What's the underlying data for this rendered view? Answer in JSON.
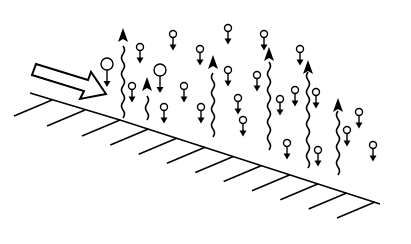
{
  "diagram": {
    "colors": {
      "stroke": "#000000",
      "background": "#ffffff"
    },
    "surface": {
      "points": [
        [
          30,
          93
        ],
        [
          120,
          120
        ],
        [
          380,
          204
        ]
      ],
      "hatch_count": 10
    },
    "incident_arrow": {
      "label": "",
      "direction": "down-right"
    },
    "rising_arrows": [
      {
        "x": 123,
        "top": 28,
        "bottom": 118
      },
      {
        "x": 147,
        "top": 77,
        "bottom": 120
      },
      {
        "x": 213,
        "top": 55,
        "bottom": 137
      },
      {
        "x": 269,
        "top": 47,
        "bottom": 150
      },
      {
        "x": 308,
        "top": 60,
        "bottom": 168
      },
      {
        "x": 338,
        "top": 98,
        "bottom": 175
      }
    ],
    "falling_particles": [
      {
        "x": 107,
        "y": 64,
        "r": 6
      },
      {
        "x": 160,
        "y": 70,
        "r": 6
      },
      {
        "x": 140,
        "y": 47,
        "r": 3.5
      },
      {
        "x": 173,
        "y": 34,
        "r": 3.5
      },
      {
        "x": 132,
        "y": 86,
        "r": 3.5
      },
      {
        "x": 164,
        "y": 107,
        "r": 3.5
      },
      {
        "x": 184,
        "y": 86,
        "r": 3.5
      },
      {
        "x": 200,
        "y": 49,
        "r": 3.5
      },
      {
        "x": 201,
        "y": 107,
        "r": 3.5
      },
      {
        "x": 228,
        "y": 28,
        "r": 3.5
      },
      {
        "x": 228,
        "y": 70,
        "r": 3.5
      },
      {
        "x": 238,
        "y": 98,
        "r": 3.5
      },
      {
        "x": 243,
        "y": 120,
        "r": 3.5
      },
      {
        "x": 257,
        "y": 75,
        "r": 3.5
      },
      {
        "x": 264,
        "y": 34,
        "r": 3.5
      },
      {
        "x": 280,
        "y": 99,
        "r": 3.5
      },
      {
        "x": 300,
        "y": 49,
        "r": 3.5
      },
      {
        "x": 295,
        "y": 90,
        "r": 3.5
      },
      {
        "x": 316,
        "y": 92,
        "r": 3.5
      },
      {
        "x": 287,
        "y": 143,
        "r": 3.5
      },
      {
        "x": 318,
        "y": 150,
        "r": 3.5
      },
      {
        "x": 347,
        "y": 130,
        "r": 3.5
      },
      {
        "x": 359,
        "y": 112,
        "r": 3.5
      },
      {
        "x": 373,
        "y": 145,
        "r": 3.5
      }
    ]
  }
}
